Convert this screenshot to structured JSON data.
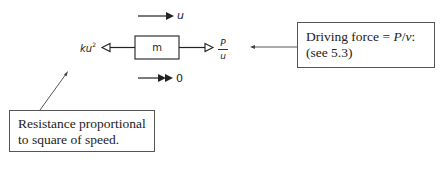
{
  "diagram": {
    "velocity": {
      "label": "u",
      "arrow": "single-filled"
    },
    "acceleration": {
      "label": "0",
      "arrow": "double-filled"
    },
    "mass": {
      "label": "m"
    },
    "resistance_force": {
      "label_base": "ku",
      "label_exp": "2",
      "direction": "left"
    },
    "driving_force": {
      "numerator": "P",
      "denominator": "u",
      "direction": "right"
    },
    "callout_driving": {
      "line1_prefix": "Driving force = ",
      "line1_var": "P",
      "line1_slash": "/",
      "line1_var2": "v",
      "line1_suffix": ":",
      "line2": "(see 5.3)"
    },
    "callout_resistance": {
      "line1": "Resistance proportional",
      "line2": "to square of speed."
    },
    "colors": {
      "ink": "#222222",
      "background": "#ffffff"
    }
  }
}
